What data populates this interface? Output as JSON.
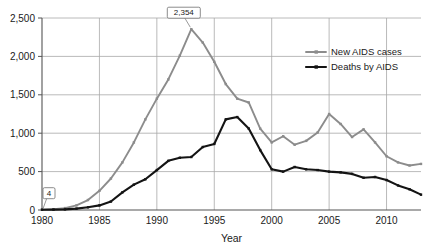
{
  "chart_data": {
    "type": "line",
    "title": "",
    "xlabel": "Year",
    "ylabel": "",
    "xlim": [
      1980,
      2013
    ],
    "ylim": [
      0,
      2500
    ],
    "grid": true,
    "legend_position": "right",
    "x_ticks": [
      "1980",
      "1985",
      "1990",
      "1995",
      "2000",
      "2005",
      "2010"
    ],
    "x_tick_values": [
      1980,
      1985,
      1990,
      1995,
      2000,
      2005,
      2010
    ],
    "y_ticks": [
      "0",
      "500",
      "1,000",
      "1,500",
      "2,000",
      "2,500"
    ],
    "y_tick_values": [
      0,
      500,
      1000,
      1500,
      2000,
      2500
    ],
    "x": [
      1980,
      1981,
      1982,
      1983,
      1984,
      1985,
      1986,
      1987,
      1988,
      1989,
      1990,
      1991,
      1992,
      1993,
      1994,
      1995,
      1996,
      1997,
      1998,
      1999,
      2000,
      2001,
      2002,
      2003,
      2004,
      2005,
      2006,
      2007,
      2008,
      2009,
      2010,
      2011,
      2012,
      2013
    ],
    "series": [
      {
        "name": "New AIDS cases",
        "color": "#8c8c8c",
        "values": [
          4,
          10,
          25,
          60,
          130,
          250,
          410,
          620,
          880,
          1180,
          1450,
          1700,
          2010,
          2354,
          2180,
          1930,
          1640,
          1450,
          1400,
          1060,
          880,
          960,
          850,
          900,
          1010,
          1250,
          1120,
          950,
          1050,
          880,
          700,
          620,
          580,
          600
        ]
      },
      {
        "name": "Deaths by AIDS",
        "color": "#141414",
        "values": [
          4,
          5,
          8,
          18,
          35,
          60,
          110,
          230,
          330,
          400,
          520,
          640,
          680,
          690,
          820,
          860,
          1180,
          1210,
          1060,
          780,
          530,
          500,
          560,
          530,
          520,
          500,
          490,
          470,
          420,
          430,
          390,
          320,
          270,
          200
        ]
      }
    ],
    "annotations": [
      {
        "label": "2,354",
        "x": 1993,
        "y": 2354,
        "series": "New AIDS cases"
      },
      {
        "label": "4",
        "x": 1980,
        "y": 4,
        "series": "New AIDS cases"
      }
    ],
    "legend": [
      {
        "label": "New AIDS cases",
        "color": "#8c8c8c"
      },
      {
        "label": "Deaths by AIDS",
        "color": "#141414"
      }
    ]
  }
}
